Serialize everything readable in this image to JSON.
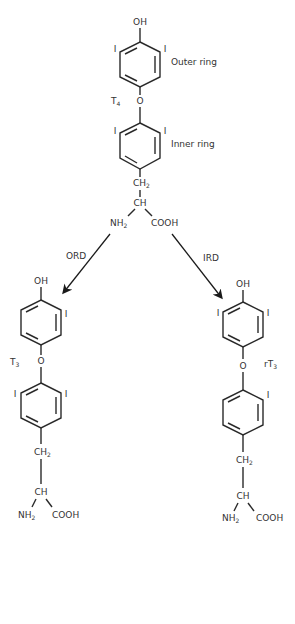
{
  "diagram": {
    "type": "chemical-reaction-scheme",
    "colors": {
      "lines": "#2a2a2a",
      "text": "#333333",
      "background": "#ffffff"
    },
    "top_molecule": {
      "name": "T",
      "name_sub": "4",
      "hydroxyl": "OH",
      "outer_ring_label": "Outer ring",
      "inner_ring_label": "Inner ring",
      "ether_oxygen": "O",
      "iodine_outer_left": "I",
      "iodine_outer_right": "I",
      "iodine_inner_left": "I",
      "iodine_inner_right": "I",
      "ch2": "CH",
      "ch2_sub": "2",
      "ch": "CH",
      "nh2": "NH",
      "nh2_sub": "2",
      "cooh": "COOH"
    },
    "left_pathway": {
      "enzyme_label": "ORD",
      "product": {
        "name": "T",
        "name_sub": "3",
        "hydroxyl": "OH",
        "ether_oxygen": "O",
        "iodine_outer_right": "I",
        "iodine_inner_left": "I",
        "iodine_inner_right": "I",
        "ch2": "CH",
        "ch2_sub": "2",
        "ch": "CH",
        "nh2": "NH",
        "nh2_sub": "2",
        "cooh": "COOH"
      }
    },
    "right_pathway": {
      "enzyme_label": "IRD",
      "product": {
        "name": "rT",
        "name_sub": "3",
        "hydroxyl": "OH",
        "ether_oxygen": "O",
        "iodine_outer_left": "I",
        "iodine_outer_right": "I",
        "iodine_inner_right": "I",
        "ch2": "CH",
        "ch2_sub": "2",
        "ch": "CH",
        "nh2": "NH",
        "nh2_sub": "2",
        "cooh": "COOH"
      }
    }
  }
}
